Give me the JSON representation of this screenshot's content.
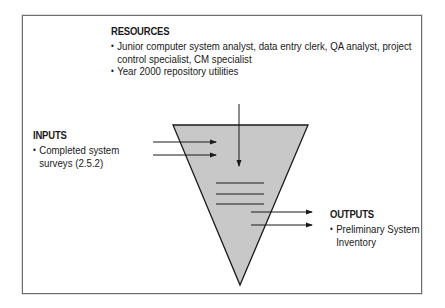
{
  "resources": {
    "heading": "RESOURCES",
    "items": [
      {
        "lines": [
          "Junior computer system analyst, data entry clerk, QA analyst, project",
          "control specialist, CM specialist"
        ]
      },
      {
        "lines": [
          "Year 2000 repository utilities"
        ]
      }
    ]
  },
  "inputs": {
    "heading": "INPUTS",
    "items": [
      {
        "lines": [
          "Completed system",
          "surveys (2.5.2)"
        ]
      }
    ]
  },
  "outputs": {
    "heading": "OUTPUTS",
    "items": [
      {
        "lines": [
          "Preliminary System",
          "Inventory"
        ]
      }
    ]
  },
  "colors": {
    "funnel_fill": "#c8c8c8",
    "stroke": "#1a1a1a",
    "frame_border": "#6e6e6e"
  }
}
